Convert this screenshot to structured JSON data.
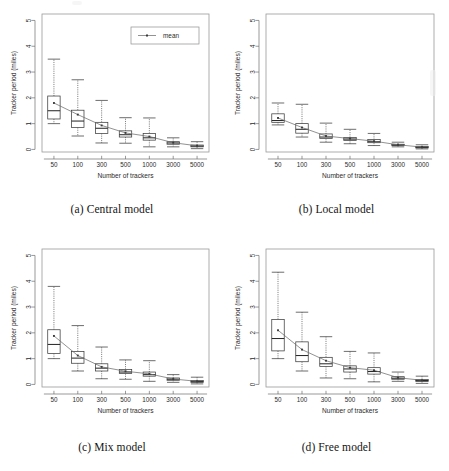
{
  "figure": {
    "panels": [
      {
        "id": "central",
        "caption": "(a) Central model",
        "xlabel": "Number of trackers",
        "ylabel": "Tracker period (miles)",
        "has_legend": true,
        "legend_label": "mean"
      },
      {
        "id": "local",
        "caption": "(b) Local model",
        "xlabel": "Number of trackers",
        "ylabel": "Tracker period (miles)",
        "has_legend": false,
        "legend_label": "mean"
      },
      {
        "id": "mix",
        "caption": "(c) Mix model",
        "xlabel": "Number of trackers",
        "ylabel": "Tracker period (miles)",
        "has_legend": false,
        "legend_label": "mean"
      },
      {
        "id": "free",
        "caption": "(d) Free model",
        "xlabel": "Number of trackers",
        "ylabel": "Tracker period (miles)",
        "has_legend": false,
        "legend_label": "mean"
      }
    ]
  },
  "chart_data": [
    {
      "type": "box",
      "panel": "a",
      "title": "(a) Central model",
      "xlabel": "Number of trackers",
      "ylabel": "Tracker period (miles)",
      "categories": [
        "50",
        "100",
        "300",
        "500",
        "1000",
        "3000",
        "5000"
      ],
      "yticks": [
        0,
        1,
        2,
        3,
        4,
        5
      ],
      "ylim": [
        -0.1,
        5.25
      ],
      "grid": false,
      "legend": {
        "entries": [
          "mean"
        ],
        "position": "top-right"
      },
      "boxes": [
        {
          "category": "50",
          "whisker_low": 1.0,
          "q1": 1.18,
          "median": 1.5,
          "q3": 2.07,
          "whisker_high": 3.5,
          "mean": 1.8
        },
        {
          "category": "100",
          "whisker_low": 0.52,
          "q1": 0.85,
          "median": 1.1,
          "q3": 1.52,
          "whisker_high": 2.7,
          "mean": 1.35
        },
        {
          "category": "300",
          "whisker_low": 0.25,
          "q1": 0.62,
          "median": 0.82,
          "q3": 1.05,
          "whisker_high": 1.9,
          "mean": 0.93
        },
        {
          "category": "500",
          "whisker_low": 0.24,
          "q1": 0.48,
          "median": 0.57,
          "q3": 0.72,
          "whisker_high": 1.23,
          "mean": 0.64
        },
        {
          "category": "1000",
          "whisker_low": 0.1,
          "q1": 0.36,
          "median": 0.45,
          "q3": 0.62,
          "whisker_high": 1.22,
          "mean": 0.5
        },
        {
          "category": "3000",
          "whisker_low": 0.1,
          "q1": 0.2,
          "median": 0.25,
          "q3": 0.3,
          "whisker_high": 0.45,
          "mean": 0.26
        },
        {
          "category": "5000",
          "whisker_low": 0.03,
          "q1": 0.1,
          "median": 0.13,
          "q3": 0.17,
          "whisker_high": 0.3,
          "mean": 0.14
        }
      ],
      "mean_series": [
        1.8,
        1.35,
        0.93,
        0.64,
        0.5,
        0.26,
        0.14
      ]
    },
    {
      "type": "box",
      "panel": "b",
      "title": "(b) Local model",
      "xlabel": "Number of trackers",
      "ylabel": "Tracker period (miles)",
      "categories": [
        "50",
        "100",
        "300",
        "500",
        "1000",
        "3000",
        "5000"
      ],
      "yticks": [
        0,
        1,
        2,
        3,
        4,
        5
      ],
      "ylim": [
        -0.1,
        5.25
      ],
      "grid": false,
      "legend": null,
      "boxes": [
        {
          "category": "50",
          "whisker_low": 0.95,
          "q1": 1.05,
          "median": 1.12,
          "q3": 1.38,
          "whisker_high": 1.8,
          "mean": 1.22
        },
        {
          "category": "100",
          "whisker_low": 0.48,
          "q1": 0.63,
          "median": 0.78,
          "q3": 1.0,
          "whisker_high": 1.75,
          "mean": 0.85
        },
        {
          "category": "300",
          "whisker_low": 0.28,
          "q1": 0.42,
          "median": 0.48,
          "q3": 0.6,
          "whisker_high": 1.02,
          "mean": 0.52
        },
        {
          "category": "500",
          "whisker_low": 0.22,
          "q1": 0.35,
          "median": 0.4,
          "q3": 0.46,
          "whisker_high": 0.78,
          "mean": 0.42
        },
        {
          "category": "1000",
          "whisker_low": 0.15,
          "q1": 0.26,
          "median": 0.3,
          "q3": 0.38,
          "whisker_high": 0.62,
          "mean": 0.32
        },
        {
          "category": "3000",
          "whisker_low": 0.1,
          "q1": 0.15,
          "median": 0.17,
          "q3": 0.2,
          "whisker_high": 0.28,
          "mean": 0.18
        },
        {
          "category": "5000",
          "whisker_low": 0.02,
          "q1": 0.06,
          "median": 0.08,
          "q3": 0.11,
          "whisker_high": 0.18,
          "mean": 0.09
        }
      ],
      "mean_series": [
        1.22,
        0.85,
        0.52,
        0.42,
        0.32,
        0.18,
        0.09
      ]
    },
    {
      "type": "box",
      "panel": "c",
      "title": "(c) Mix model",
      "xlabel": "Number of trackers",
      "ylabel": "Tracker period (miles)",
      "categories": [
        "50",
        "100",
        "300",
        "500",
        "1000",
        "3000",
        "5000"
      ],
      "yticks": [
        0,
        1,
        2,
        3,
        4,
        5
      ],
      "ylim": [
        -0.1,
        5.25
      ],
      "grid": false,
      "legend": null,
      "boxes": [
        {
          "category": "50",
          "whisker_low": 1.0,
          "q1": 1.2,
          "median": 1.55,
          "q3": 2.12,
          "whisker_high": 3.8,
          "mean": 1.88
        },
        {
          "category": "100",
          "whisker_low": 0.52,
          "q1": 0.82,
          "median": 1.02,
          "q3": 1.28,
          "whisker_high": 2.28,
          "mean": 1.12
        },
        {
          "category": "300",
          "whisker_low": 0.22,
          "q1": 0.52,
          "median": 0.63,
          "q3": 0.8,
          "whisker_high": 1.45,
          "mean": 0.68
        },
        {
          "category": "500",
          "whisker_low": 0.2,
          "q1": 0.42,
          "median": 0.48,
          "q3": 0.58,
          "whisker_high": 0.95,
          "mean": 0.51
        },
        {
          "category": "1000",
          "whisker_low": 0.12,
          "q1": 0.32,
          "median": 0.38,
          "q3": 0.48,
          "whisker_high": 0.92,
          "mean": 0.41
        },
        {
          "category": "3000",
          "whisker_low": 0.08,
          "q1": 0.16,
          "median": 0.2,
          "q3": 0.25,
          "whisker_high": 0.38,
          "mean": 0.21
        },
        {
          "category": "5000",
          "whisker_low": 0.02,
          "q1": 0.08,
          "median": 0.11,
          "q3": 0.15,
          "whisker_high": 0.28,
          "mean": 0.12
        }
      ],
      "mean_series": [
        1.88,
        1.12,
        0.68,
        0.51,
        0.41,
        0.21,
        0.12
      ]
    },
    {
      "type": "box",
      "panel": "d",
      "title": "(d) Free model",
      "xlabel": "Number of trackers",
      "ylabel": "Tracker period (miles)",
      "categories": [
        "50",
        "100",
        "300",
        "500",
        "1000",
        "3000",
        "5000"
      ],
      "yticks": [
        0,
        1,
        2,
        3,
        4,
        5
      ],
      "ylim": [
        -0.1,
        5.25
      ],
      "grid": false,
      "legend": null,
      "boxes": [
        {
          "category": "50",
          "whisker_low": 1.0,
          "q1": 1.3,
          "median": 1.78,
          "q3": 2.52,
          "whisker_high": 4.35,
          "mean": 2.1
        },
        {
          "category": "100",
          "whisker_low": 0.52,
          "q1": 0.88,
          "median": 1.12,
          "q3": 1.65,
          "whisker_high": 2.8,
          "mean": 1.35
        },
        {
          "category": "300",
          "whisker_low": 0.25,
          "q1": 0.7,
          "median": 0.8,
          "q3": 1.05,
          "whisker_high": 1.85,
          "mean": 0.92
        },
        {
          "category": "500",
          "whisker_low": 0.22,
          "q1": 0.48,
          "median": 0.6,
          "q3": 0.72,
          "whisker_high": 1.28,
          "mean": 0.65
        },
        {
          "category": "1000",
          "whisker_low": 0.1,
          "q1": 0.4,
          "median": 0.5,
          "q3": 0.65,
          "whisker_high": 1.22,
          "mean": 0.55
        },
        {
          "category": "3000",
          "whisker_low": 0.12,
          "q1": 0.2,
          "median": 0.24,
          "q3": 0.3,
          "whisker_high": 0.48,
          "mean": 0.26
        },
        {
          "category": "5000",
          "whisker_low": 0.04,
          "q1": 0.11,
          "median": 0.15,
          "q3": 0.19,
          "whisker_high": 0.32,
          "mean": 0.16
        }
      ],
      "mean_series": [
        2.1,
        1.35,
        0.92,
        0.65,
        0.55,
        0.26,
        0.16
      ]
    }
  ]
}
